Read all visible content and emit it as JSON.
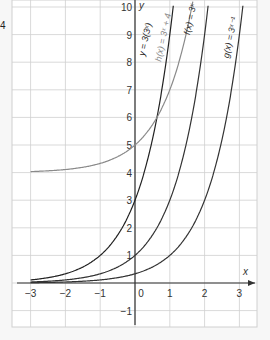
{
  "corner_label": "4",
  "chart_data": {
    "type": "line",
    "title": "",
    "xlabel": "x",
    "ylabel": "y",
    "xlim": [
      -3.5,
      3.5
    ],
    "ylim": [
      -1.6,
      10.3
    ],
    "grid": true,
    "x_ticks": [
      -3,
      -2,
      -1,
      0,
      1,
      2,
      3
    ],
    "y_ticks": [
      -1,
      1,
      2,
      3,
      4,
      5,
      6,
      7,
      8,
      9,
      10
    ],
    "series": [
      {
        "name": "y = 3(3^x)",
        "label": "y = 3(3ˣ)",
        "color": "#222222",
        "expr": "3*3^x"
      },
      {
        "name": "h(x) = 3^x + 4",
        "label": "h(x) = 3ˣ + 4",
        "color": "#8a8a8a",
        "expr": "3^x+4"
      },
      {
        "name": "f(x) = 3^x",
        "label": "f(x) = 3ˣ",
        "color": "#333333",
        "expr": "3^x"
      },
      {
        "name": "g(x) = 3^(x-1)",
        "label": "g(x) = 3ˣ⁻¹",
        "color": "#333333",
        "expr": "3^(x-1)"
      }
    ]
  }
}
